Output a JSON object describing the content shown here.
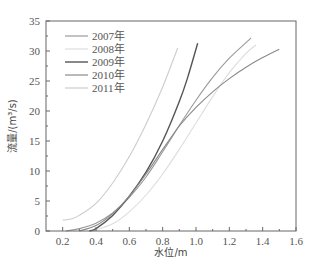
{
  "chart_data": {
    "type": "line",
    "title": "",
    "xlabel": "水位/m",
    "ylabel": "流量/(m³/s)",
    "xlim": [
      0.1,
      1.6
    ],
    "ylim": [
      0,
      35
    ],
    "xticks": [
      0.2,
      0.4,
      0.6,
      0.8,
      1.0,
      1.2,
      1.4,
      1.6
    ],
    "xtick_labels": [
      "0.2",
      "0.4",
      "0.6",
      "0.8",
      "1.0",
      "1.2",
      "1.4",
      "1.6"
    ],
    "yticks": [
      0,
      5,
      10,
      15,
      20,
      25,
      30,
      35
    ],
    "ytick_labels": [
      "0",
      "5",
      "10",
      "15",
      "20",
      "25",
      "30",
      "35"
    ],
    "grid": false,
    "legend_position": "upper left",
    "series": [
      {
        "name": "2007年",
        "color": "#9a9a9a",
        "x": [
          0.22,
          0.3,
          0.4,
          0.5,
          0.6,
          0.7,
          0.8,
          0.9,
          1.0,
          1.1,
          1.2,
          1.3,
          1.33
        ],
        "y": [
          0.0,
          0.4,
          1.3,
          3.0,
          5.6,
          9.0,
          13.2,
          17.6,
          21.8,
          25.6,
          28.8,
          31.4,
          32.2
        ]
      },
      {
        "name": "2008年",
        "color": "#dddddd",
        "x": [
          0.38,
          0.5,
          0.6,
          0.7,
          0.8,
          0.9,
          1.0,
          1.1,
          1.2,
          1.3,
          1.36
        ],
        "y": [
          0.0,
          1.2,
          3.2,
          6.0,
          9.5,
          13.6,
          18.0,
          22.4,
          26.4,
          29.6,
          31.0
        ]
      },
      {
        "name": "2009年",
        "color": "#555555",
        "x": [
          0.36,
          0.4,
          0.5,
          0.6,
          0.7,
          0.8,
          0.9,
          0.95,
          1.01
        ],
        "y": [
          0.0,
          0.4,
          2.6,
          5.8,
          9.8,
          15.0,
          21.6,
          25.6,
          31.3
        ]
      },
      {
        "name": "2010年",
        "color": "#8a8a8a",
        "x": [
          0.3,
          0.4,
          0.5,
          0.6,
          0.7,
          0.8,
          0.9,
          1.0,
          1.1,
          1.2,
          1.3,
          1.4,
          1.5
        ],
        "y": [
          0.0,
          0.9,
          2.9,
          5.8,
          9.5,
          13.6,
          17.5,
          20.6,
          23.2,
          25.4,
          27.3,
          28.9,
          30.3
        ]
      },
      {
        "name": "2011年",
        "color": "#cccccc",
        "x": [
          0.2,
          0.25,
          0.3,
          0.4,
          0.5,
          0.6,
          0.7,
          0.8,
          0.89
        ],
        "y": [
          1.8,
          2.0,
          2.6,
          4.6,
          8.0,
          12.4,
          17.8,
          24.0,
          30.5
        ]
      }
    ]
  },
  "legend": {
    "items": [
      {
        "label": "2007年"
      },
      {
        "label": "2008年"
      },
      {
        "label": "2009年"
      },
      {
        "label": "2010年"
      },
      {
        "label": "2011年"
      }
    ]
  }
}
